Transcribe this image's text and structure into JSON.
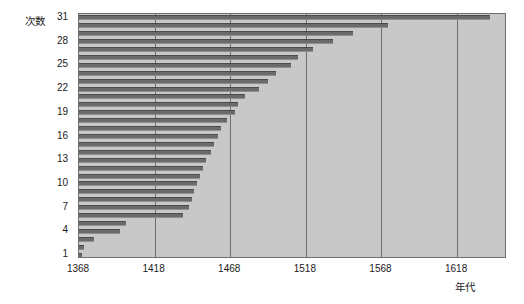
{
  "chart_data": {
    "type": "bar",
    "orientation": "horizontal",
    "title": "",
    "subtitle": "",
    "xlabel": "年代",
    "ylabel": "次数",
    "xlim": [
      1368,
      1651
    ],
    "ylim": [
      1,
      31
    ],
    "grid": true,
    "grid_axis": "x",
    "legend": false,
    "legend_position": "none",
    "xticks": [
      1368,
      1418,
      1468,
      1518,
      1568,
      1618
    ],
    "yticks": [
      1,
      4,
      7,
      10,
      13,
      16,
      19,
      22,
      25,
      28,
      31
    ],
    "categories": [
      1,
      2,
      3,
      4,
      5,
      6,
      7,
      8,
      9,
      10,
      11,
      12,
      13,
      14,
      15,
      16,
      17,
      18,
      19,
      20,
      21,
      22,
      23,
      24,
      25,
      26,
      27,
      28,
      29,
      30,
      31
    ],
    "values": [
      1370,
      1371,
      1378,
      1395,
      1399,
      1437,
      1441,
      1443,
      1444,
      1446,
      1448,
      1450,
      1452,
      1455,
      1457,
      1460,
      1462,
      1466,
      1471,
      1473,
      1478,
      1487,
      1493,
      1498,
      1508,
      1513,
      1523,
      1536,
      1549,
      1572,
      1640
    ],
    "bar_color": "#6b6b6b",
    "plot_background": "#c8c8c8"
  },
  "axis": {
    "y_title": "次数",
    "x_title": "年代",
    "y_tick_labels": [
      "31",
      "28",
      "25",
      "22",
      "19",
      "16",
      "13",
      "10",
      "7",
      "4",
      "1"
    ],
    "x_tick_labels": [
      "1368",
      "1418",
      "1468",
      "1518",
      "1568",
      "1618"
    ]
  }
}
